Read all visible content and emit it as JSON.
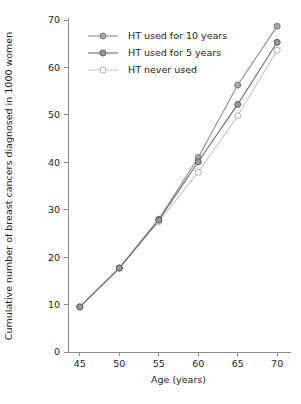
{
  "chart_data": {
    "type": "line",
    "title": "",
    "xlabel": "Age (years)",
    "ylabel": "Cumulative number of breast cancers diagnosed in 1000 women",
    "x": [
      45,
      50,
      55,
      60,
      65,
      70
    ],
    "xticks": [
      "45",
      "50",
      "55",
      "60",
      "65",
      "70"
    ],
    "yticks": [
      "0",
      "10",
      "20",
      "30",
      "40",
      "50",
      "60",
      "70"
    ],
    "xlim": [
      43.5,
      71.5
    ],
    "ylim": [
      0,
      70
    ],
    "grid": false,
    "legend_position": "top-left-inside",
    "series": [
      {
        "name": "HT used for 10 years",
        "values": [
          9.5,
          17.7,
          28.0,
          41.0,
          56.3,
          68.7
        ],
        "color": "#8f8f8f",
        "marker_fill": "#a8a8a8",
        "marker_stroke": "#7a7a7a"
      },
      {
        "name": "HT used for 5 years",
        "values": [
          9.5,
          17.7,
          27.8,
          40.1,
          52.2,
          65.3
        ],
        "color": "#6e6e6e",
        "marker_fill": "#999999",
        "marker_stroke": "#5e5e5e"
      },
      {
        "name": "HT never used",
        "values": [
          9.5,
          17.7,
          27.5,
          37.9,
          49.8,
          63.6
        ],
        "color": "#c9c9c9",
        "marker_fill": "#ffffff",
        "marker_stroke": "#b0b0b0"
      }
    ]
  },
  "colors": {
    "axis": "#8c8c8c",
    "text": "#231f20",
    "background": "#ffffff"
  }
}
